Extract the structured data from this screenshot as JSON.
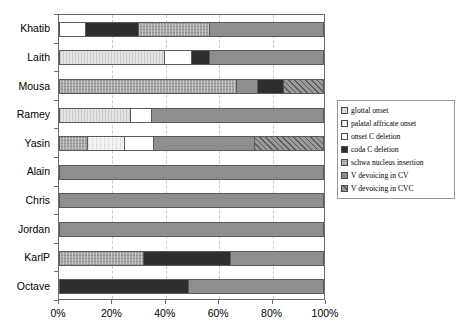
{
  "chart_data": {
    "type": "bar",
    "orientation": "horizontal",
    "stacked": true,
    "normalized_percent": true,
    "title": "",
    "xlabel": "",
    "ylabel": "",
    "xlim": [
      0,
      100
    ],
    "xticks": [
      "0%",
      "20%",
      "40%",
      "60%",
      "80%",
      "100%"
    ],
    "xtick_values": [
      0,
      20,
      40,
      60,
      80,
      100
    ],
    "grid": "vertical dashed gridlines at 20% intervals",
    "legend_position": "right",
    "categories": [
      "Khatib",
      "Laith",
      "Mousa",
      "Ramey",
      "Yasin",
      "Alain",
      "Chris",
      "Jordan",
      "KarlP",
      "Octave"
    ],
    "series": [
      {
        "name": "glottal onset",
        "key": "glottal",
        "pattern": "light-gray-vertical-texture",
        "color": "#e3e3e3",
        "values": [
          0,
          40,
          0,
          27,
          0,
          0,
          0,
          0,
          0,
          0
        ]
      },
      {
        "name": "palatal affricate onset",
        "key": "palatal",
        "pattern": "near-white-dotted",
        "color": "#f2f2f2",
        "values": [
          0,
          0,
          0,
          0,
          14,
          0,
          0,
          0,
          0,
          0
        ]
      },
      {
        "name": "onset C deletion",
        "key": "onsetdel",
        "pattern": "solid-white",
        "color": "#ffffff",
        "values": [
          10,
          10,
          0,
          8,
          11,
          0,
          0,
          0,
          0,
          0
        ]
      },
      {
        "name": "coda C deletion",
        "key": "codadel",
        "pattern": "solid-near-black",
        "color": "#2e2e2e",
        "values": [
          20,
          7,
          0,
          0,
          0,
          0,
          0,
          0,
          33,
          49
        ]
      },
      {
        "name": "schwa nucleus insertion",
        "key": "schwa",
        "pattern": "mid-gray-crosshatch",
        "color": "#a8a8a8",
        "values": [
          27,
          0,
          67,
          0,
          11,
          0,
          0,
          0,
          32,
          0
        ]
      },
      {
        "name": "V devoicing in CV",
        "key": "vcv",
        "pattern": "flat-medium-gray",
        "color": "#8e8e8e",
        "values": [
          43,
          43,
          8,
          65,
          38,
          100,
          100,
          100,
          35,
          51
        ]
      },
      {
        "name": "V devoicing in CVC",
        "key": "vcvc",
        "pattern": "gray-diagonal-hatch",
        "color": "#9a9a9a",
        "values": [
          0,
          0,
          25,
          0,
          26,
          0,
          0,
          0,
          0,
          0
        ]
      }
    ],
    "bars": [
      {
        "category": "Khatib",
        "segments": [
          {
            "series": "onset C deletion",
            "key": "onsetdel",
            "value": 10
          },
          {
            "series": "coda C deletion",
            "key": "codadel",
            "value": 20
          },
          {
            "series": "schwa nucleus insertion",
            "key": "schwa",
            "value": 27
          },
          {
            "series": "V devoicing in CV",
            "key": "vcv",
            "value": 43
          }
        ]
      },
      {
        "category": "Laith",
        "segments": [
          {
            "series": "glottal onset",
            "key": "glottal",
            "value": 40
          },
          {
            "series": "onset C deletion",
            "key": "onsetdel",
            "value": 10
          },
          {
            "series": "coda C deletion",
            "key": "codadel",
            "value": 7
          },
          {
            "series": "V devoicing in CV",
            "key": "vcv",
            "value": 43
          }
        ]
      },
      {
        "category": "Mousa",
        "segments": [
          {
            "series": "schwa nucleus insertion",
            "key": "schwa",
            "value": 67
          },
          {
            "series": "palatal affricate onset",
            "key": "palatal",
            "value": 0
          },
          {
            "series": "V devoicing in CV",
            "key": "vcv",
            "value": 8
          },
          {
            "series": "coda C deletion",
            "key": "codadel",
            "value": 10
          },
          {
            "series": "V devoicing in CVC",
            "key": "vcvc",
            "value": 15
          }
        ]
      },
      {
        "category": "Ramey",
        "segments": [
          {
            "series": "glottal onset",
            "key": "glottal",
            "value": 27
          },
          {
            "series": "onset C deletion",
            "key": "onsetdel",
            "value": 8
          },
          {
            "series": "V devoicing in CV",
            "key": "vcv",
            "value": 65
          }
        ]
      },
      {
        "category": "Yasin",
        "segments": [
          {
            "series": "schwa nucleus insertion",
            "key": "schwa",
            "value": 11
          },
          {
            "series": "palatal affricate onset",
            "key": "palatal",
            "value": 14
          },
          {
            "series": "onset C deletion",
            "key": "onsetdel",
            "value": 11
          },
          {
            "series": "V devoicing in CV",
            "key": "vcv",
            "value": 38
          },
          {
            "series": "V devoicing in CVC",
            "key": "vcvc",
            "value": 26
          }
        ]
      },
      {
        "category": "Alain",
        "segments": [
          {
            "series": "V devoicing in CV",
            "key": "vcv",
            "value": 100
          }
        ]
      },
      {
        "category": "Chris",
        "segments": [
          {
            "series": "V devoicing in CV",
            "key": "vcv",
            "value": 100
          }
        ]
      },
      {
        "category": "Jordan",
        "segments": [
          {
            "series": "V devoicing in CV",
            "key": "vcv",
            "value": 100
          }
        ]
      },
      {
        "category": "KarlP",
        "segments": [
          {
            "series": "schwa nucleus insertion",
            "key": "schwa",
            "value": 32
          },
          {
            "series": "coda C deletion",
            "key": "codadel",
            "value": 33
          },
          {
            "series": "V devoicing in CV",
            "key": "vcv",
            "value": 35
          }
        ]
      },
      {
        "category": "Octave",
        "segments": [
          {
            "series": "coda C deletion",
            "key": "codadel",
            "value": 49
          },
          {
            "series": "V devoicing in CV",
            "key": "vcv",
            "value": 51
          }
        ]
      }
    ]
  },
  "legend": {
    "items": [
      {
        "label": "glottal onset",
        "key": "glottal"
      },
      {
        "label": "palatal affricate onset",
        "key": "palatal"
      },
      {
        "label": "onset C deletion",
        "key": "onsetdel"
      },
      {
        "label": "coda C deletion",
        "key": "codadel"
      },
      {
        "label": "schwa nucleus insertion",
        "key": "schwa"
      },
      {
        "label": "V devoicing in CV",
        "key": "vcv"
      },
      {
        "label": "V devoicing in CVC",
        "key": "vcvc"
      }
    ]
  }
}
